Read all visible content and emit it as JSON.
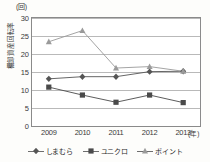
{
  "chart_data": {
    "type": "line",
    "title": "",
    "xlabel": "年",
    "ylabel": "棚卸資産回転率",
    "yunit": "(回)",
    "xunit": "(年)",
    "categories": [
      "2009",
      "2010",
      "2011",
      "2012",
      "2013"
    ],
    "ylim": [
      0,
      30
    ],
    "yticks": [
      0,
      5,
      10,
      15,
      20,
      25,
      30
    ],
    "grid": true,
    "legend_position": "bottom",
    "series": [
      {
        "name": "しまむら",
        "marker": "diamond",
        "color": "#555555",
        "values": [
          13.1,
          13.7,
          13.7,
          15.1,
          15.2
        ]
      },
      {
        "name": "ユニクロ",
        "marker": "square",
        "color": "#4a4a4a",
        "values": [
          10.8,
          8.6,
          6.6,
          8.6,
          6.5
        ]
      },
      {
        "name": "ポイント",
        "marker": "triangle",
        "color": "#9a9a9a",
        "values": [
          23.4,
          26.5,
          16.1,
          16.5,
          15.2
        ]
      }
    ]
  },
  "axis": {
    "unit_top": "(回)",
    "vertical_title": "棚卸資産回転率",
    "x_unit_suffix": "(年)",
    "ytick_labels": [
      "30",
      "25",
      "20",
      "15",
      "10",
      "5",
      "0"
    ],
    "xtick_labels": [
      "2009",
      "2010",
      "2011",
      "2012",
      "2013"
    ]
  },
  "legend": {
    "items": [
      {
        "label": "しまむら"
      },
      {
        "label": "ユニクロ"
      },
      {
        "label": "ポイント"
      }
    ]
  }
}
